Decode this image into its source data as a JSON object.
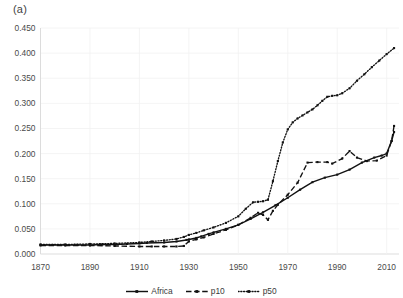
{
  "figure": {
    "panel_label": "(a)"
  },
  "legend": {
    "position": "bottom-center",
    "entries": [
      {
        "label": "Africa",
        "style": "solid",
        "marker": "square",
        "color": "#121212"
      },
      {
        "label": "p10",
        "style": "dashed",
        "marker": "square",
        "color": "#121212"
      },
      {
        "label": "p50",
        "style": "dotted",
        "marker": "square",
        "color": "#121212"
      }
    ]
  },
  "chart_data": {
    "type": "line",
    "title": "",
    "subtitle": "",
    "xlabel": "",
    "ylabel": "",
    "xlim": [
      1870,
      2015
    ],
    "ylim": [
      0.0,
      0.45
    ],
    "grid": true,
    "xticks": [
      1870,
      1890,
      1910,
      1930,
      1950,
      1970,
      1990,
      2010
    ],
    "xtick_labels": [
      "1870",
      "1890",
      "1910",
      "1930",
      "1950",
      "1970",
      "1990",
      "2010"
    ],
    "yticks": [
      0.0,
      0.05,
      0.1,
      0.15,
      0.2,
      0.25,
      0.3,
      0.35,
      0.4,
      0.45
    ],
    "ytick_labels": [
      "0.000",
      "0.050",
      "0.100",
      "0.150",
      "0.200",
      "0.250",
      "0.300",
      "0.350",
      "0.400",
      "0.450"
    ],
    "series": [
      {
        "name": "Africa",
        "style": "solid",
        "x": [
          1870,
          1875,
          1880,
          1885,
          1890,
          1895,
          1900,
          1905,
          1910,
          1913,
          1920,
          1925,
          1929,
          1930,
          1933,
          1935,
          1938,
          1940,
          1945,
          1950,
          1955,
          1960,
          1965,
          1970,
          1975,
          1980,
          1985,
          1990,
          1995,
          2000,
          2005,
          2008,
          2010,
          2012,
          2013
        ],
        "values": [
          0.018,
          0.018,
          0.018,
          0.018,
          0.018,
          0.019,
          0.019,
          0.02,
          0.021,
          0.022,
          0.023,
          0.025,
          0.028,
          0.029,
          0.032,
          0.035,
          0.04,
          0.043,
          0.05,
          0.058,
          0.07,
          0.083,
          0.097,
          0.112,
          0.128,
          0.143,
          0.152,
          0.158,
          0.168,
          0.182,
          0.192,
          0.196,
          0.2,
          0.225,
          0.243
        ]
      },
      {
        "name": "p10",
        "style": "dashed",
        "x": [
          1870,
          1880,
          1890,
          1900,
          1910,
          1915,
          1920,
          1925,
          1928,
          1930,
          1933,
          1936,
          1940,
          1945,
          1950,
          1955,
          1958,
          1960,
          1962,
          1964,
          1966,
          1970,
          1974,
          1978,
          1982,
          1986,
          1988,
          1992,
          1995,
          1998,
          2002,
          2006,
          2010,
          2012,
          2013
        ],
        "values": [
          0.017,
          0.017,
          0.017,
          0.016,
          0.015,
          0.015,
          0.015,
          0.015,
          0.016,
          0.025,
          0.029,
          0.033,
          0.04,
          0.048,
          0.058,
          0.072,
          0.082,
          0.078,
          0.068,
          0.086,
          0.098,
          0.118,
          0.142,
          0.182,
          0.183,
          0.183,
          0.18,
          0.19,
          0.205,
          0.192,
          0.185,
          0.186,
          0.196,
          0.225,
          0.255
        ]
      },
      {
        "name": "p50",
        "style": "dotted",
        "x": [
          1870,
          1880,
          1890,
          1900,
          1910,
          1915,
          1920,
          1925,
          1928,
          1930,
          1933,
          1936,
          1940,
          1945,
          1950,
          1953,
          1956,
          1958,
          1960,
          1962,
          1964,
          1966,
          1968,
          1970,
          1972,
          1974,
          1976,
          1978,
          1980,
          1982,
          1984,
          1986,
          1988,
          1990,
          1992,
          1995,
          1998,
          2001,
          2004,
          2007,
          2010,
          2013
        ],
        "values": [
          0.019,
          0.019,
          0.02,
          0.021,
          0.023,
          0.025,
          0.027,
          0.03,
          0.034,
          0.038,
          0.042,
          0.047,
          0.053,
          0.062,
          0.075,
          0.09,
          0.103,
          0.104,
          0.105,
          0.108,
          0.145,
          0.185,
          0.222,
          0.248,
          0.262,
          0.27,
          0.276,
          0.282,
          0.288,
          0.296,
          0.305,
          0.313,
          0.315,
          0.316,
          0.32,
          0.33,
          0.345,
          0.358,
          0.372,
          0.385,
          0.398,
          0.41
        ]
      }
    ]
  }
}
